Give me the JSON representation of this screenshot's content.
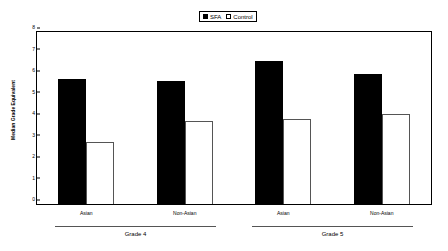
{
  "chart_data": {
    "type": "bar",
    "title": "",
    "subtitle": "",
    "xlabel": "",
    "ylabel": "Median Grade Equivalent",
    "ylim": [
      0,
      8
    ],
    "yticks": [
      0,
      1,
      2,
      3,
      4,
      5,
      6,
      7,
      8
    ],
    "ytick_labels": [
      "0",
      "1",
      "2",
      "3",
      "4",
      "5",
      "6",
      "7",
      "8"
    ],
    "grid": false,
    "legend_position": "top-center",
    "categories": [
      "Asian",
      "Non-Asian",
      "Asian",
      "Non-Asian"
    ],
    "groups": [
      {
        "label": "Grade 4",
        "categories": [
          "Asian",
          "Non-Asian"
        ]
      },
      {
        "label": "Grade 5",
        "categories": [
          "Asian",
          "Non-Asian"
        ]
      }
    ],
    "series": [
      {
        "name": "SFA",
        "color": "#000000",
        "fill": "solid",
        "values": [
          5.8,
          5.7,
          6.65,
          6.05
        ]
      },
      {
        "name": "Control",
        "color": "#ffffff",
        "fill": "open",
        "values": [
          2.9,
          3.85,
          3.95,
          4.2
        ]
      }
    ]
  },
  "legend": {
    "entries": [
      {
        "label": "SFA",
        "swatch": "filled-square-icon"
      },
      {
        "label": "Control",
        "swatch": "open-square-icon"
      }
    ]
  },
  "axes": {
    "y_title": "Median Grade Equivalent",
    "y_tick_labels": [
      "8",
      "7",
      "6",
      "5",
      "4",
      "3",
      "2",
      "1",
      "0"
    ]
  },
  "category_labels": [
    "Asian",
    "Non-Asian",
    "Asian",
    "Non-Asian"
  ],
  "group_labels": [
    "Grade 4",
    "Grade 5"
  ]
}
